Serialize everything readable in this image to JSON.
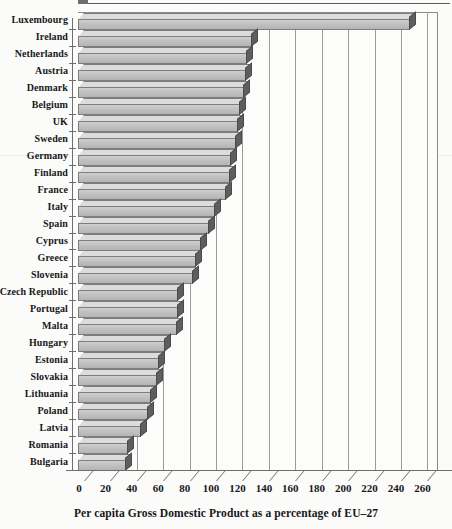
{
  "chart_data": {
    "type": "bar",
    "orientation": "horizontal",
    "title": "",
    "subtitle": "",
    "xlabel": "Per capita Gross Domestic Product as a percentage of EU–27",
    "ylabel": "",
    "xlim": [
      0,
      265
    ],
    "xticks": [
      0,
      20,
      40,
      60,
      80,
      100,
      120,
      140,
      160,
      180,
      200,
      220,
      240,
      260
    ],
    "grid": true,
    "legend": null,
    "style_3d": true,
    "bar_fill_color": "#c2c2c2",
    "bar_side_color": "#5e5e5e",
    "bar_outline_color": "#7d7d7d",
    "background_color": "#fbfbfa",
    "categories": [
      "Luxembourg",
      "Ireland",
      "Netherlands",
      "Austria",
      "Denmark",
      "Belgium",
      "UK",
      "Sweden",
      "Germany",
      "Finland",
      "France",
      "Italy",
      "Spain",
      "Cyprus",
      "Greece",
      "Slovenia",
      "Czech Republic",
      "Portugal",
      "Malta",
      "Hungary",
      "Estonia",
      "Slovakia",
      "Lithuania",
      "Poland",
      "Latvia",
      "Romania",
      "Bulgaria"
    ],
    "values": [
      251,
      132,
      128,
      127,
      126,
      123,
      121,
      120,
      116,
      115,
      112,
      104,
      99,
      93,
      89,
      87,
      76,
      76,
      75,
      66,
      61,
      60,
      55,
      53,
      48,
      38,
      36
    ],
    "series": [
      {
        "name": "Per capita GDP (% of EU-27)",
        "values": [
          251,
          132,
          128,
          127,
          126,
          123,
          121,
          120,
          116,
          115,
          112,
          104,
          99,
          93,
          89,
          87,
          76,
          76,
          75,
          66,
          61,
          60,
          55,
          53,
          48,
          38,
          36
        ]
      }
    ]
  },
  "axis": {
    "x_caption": "Per capita Gross Domestic Product as a percentage of EU–27",
    "tick_labels": [
      "0",
      "20",
      "40",
      "60",
      "80",
      "100",
      "120",
      "140",
      "160",
      "180",
      "200",
      "220",
      "240",
      "260"
    ]
  }
}
